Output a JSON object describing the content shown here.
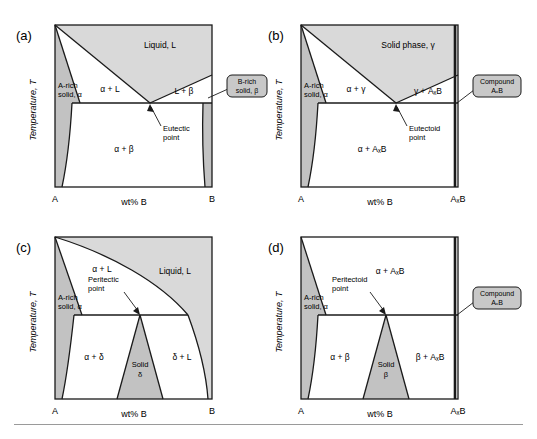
{
  "figure": {
    "panels": [
      {
        "id": "a",
        "tag": "(a)",
        "axis": {
          "ylabel": "Temperature, T",
          "xlabel": "wt% B",
          "xleft": "A",
          "xright": "B"
        },
        "regions": [
          {
            "key": "liquid",
            "label": "Liquid, L"
          },
          {
            "key": "alpha_l",
            "label": "α + L"
          },
          {
            "key": "l_beta",
            "label": "L + β"
          },
          {
            "key": "alpha_beta",
            "label": "α + β"
          },
          {
            "key": "a_rich",
            "label": "A-rich",
            "label2": "solid, α"
          }
        ],
        "annotations": [
          {
            "key": "invariant",
            "label": "Eutectic",
            "label2": "point"
          }
        ],
        "callout": {
          "line1": "B-rich",
          "line2": "solid, β"
        }
      },
      {
        "id": "b",
        "tag": "(b)",
        "axis": {
          "ylabel": "Temperature, T",
          "xlabel": "wt% B",
          "xleft": "A",
          "xright": "AₓB"
        },
        "regions": [
          {
            "key": "solid_gamma",
            "label": "Solid phase, γ"
          },
          {
            "key": "alpha_gamma",
            "label": "α + γ"
          },
          {
            "key": "gamma_axb",
            "label": "γ + AₓB"
          },
          {
            "key": "alpha_axb",
            "label": "α + AₓB"
          },
          {
            "key": "a_rich",
            "label": "A-rich",
            "label2": "solid, α"
          }
        ],
        "annotations": [
          {
            "key": "invariant",
            "label": "Eutectoid",
            "label2": "point"
          }
        ],
        "callout": {
          "line1": "Compound",
          "line2": "AₓB"
        }
      },
      {
        "id": "c",
        "tag": "(c)",
        "axis": {
          "ylabel": "Temperature, T",
          "xlabel": "wt% B",
          "xleft": "A",
          "xright": "B"
        },
        "regions": [
          {
            "key": "liquid",
            "label": "Liquid, L"
          },
          {
            "key": "alpha_l",
            "label": "α + L"
          },
          {
            "key": "alpha_delta",
            "label": "α + δ"
          },
          {
            "key": "solid_delta",
            "label": "Solid",
            "label2": "δ"
          },
          {
            "key": "delta_l",
            "label": "δ + L"
          },
          {
            "key": "a_rich",
            "label": "A-rich",
            "label2": "solid, α"
          }
        ],
        "annotations": [
          {
            "key": "invariant",
            "label": "Peritectic",
            "label2": "point"
          }
        ],
        "callout": null
      },
      {
        "id": "d",
        "tag": "(d)",
        "axis": {
          "ylabel": "Temperature, T",
          "xlabel": "wt% B",
          "xleft": "A",
          "xright": "AₓB"
        },
        "regions": [
          {
            "key": "alpha_axb",
            "label": "α + AₓB"
          },
          {
            "key": "alpha_beta",
            "label": "α + β"
          },
          {
            "key": "solid_beta",
            "label": "Solid",
            "label2": "β"
          },
          {
            "key": "beta_axb",
            "label": "β + AₓB"
          },
          {
            "key": "a_rich",
            "label": "A-rich",
            "label2": "solid, α"
          }
        ],
        "annotations": [
          {
            "key": "invariant",
            "label": "Peritectoid",
            "label2": "point"
          }
        ],
        "callout": {
          "line1": "Compound",
          "line2": "AₓB"
        }
      }
    ],
    "colors": {
      "line": "#1a1a1a",
      "text": "#1a1a1a",
      "light_shade": "#d9d9d9",
      "mid_shade": "#c2c2c2",
      "callout_fill": "#c8c8c8",
      "separator": "#9a9a9a",
      "background": "#ffffff"
    }
  }
}
